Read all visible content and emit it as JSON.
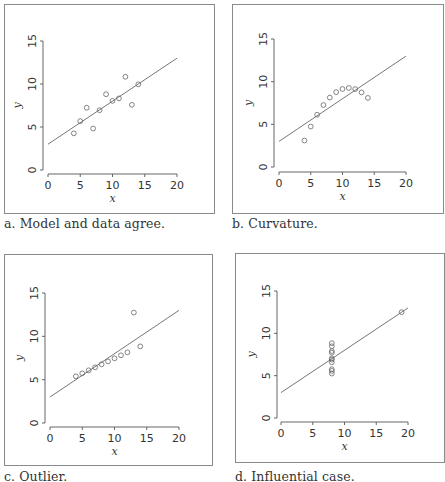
{
  "chart_data": [
    {
      "id": "a",
      "type": "scatter",
      "caption": "a. Model and data agree.",
      "xlabel": "x",
      "ylabel": "y",
      "xlim": [
        0,
        20
      ],
      "ylim": [
        0,
        15
      ],
      "xticks": [
        "0",
        "5",
        "10",
        "15",
        "20"
      ],
      "yticks": [
        "0",
        "5",
        "10",
        "15"
      ],
      "fit_line": {
        "intercept": 3.0,
        "slope": 0.5,
        "x_range": [
          0,
          20
        ]
      },
      "points": [
        {
          "x": 10,
          "y": 8.04
        },
        {
          "x": 8,
          "y": 6.95
        },
        {
          "x": 13,
          "y": 7.58
        },
        {
          "x": 9,
          "y": 8.81
        },
        {
          "x": 11,
          "y": 8.33
        },
        {
          "x": 14,
          "y": 9.96
        },
        {
          "x": 6,
          "y": 7.24
        },
        {
          "x": 4,
          "y": 4.26
        },
        {
          "x": 12,
          "y": 10.84
        },
        {
          "x": 7,
          "y": 4.82
        },
        {
          "x": 5,
          "y": 5.68
        }
      ],
      "grid": false,
      "marker": "open-circle"
    },
    {
      "id": "b",
      "type": "scatter",
      "caption": "b. Curvature.",
      "xlabel": "x",
      "ylabel": "y",
      "xlim": [
        0,
        20
      ],
      "ylim": [
        0,
        15
      ],
      "xticks": [
        "0",
        "5",
        "10",
        "15",
        "20"
      ],
      "yticks": [
        "0",
        "5",
        "10",
        "15"
      ],
      "fit_line": {
        "intercept": 3.0,
        "slope": 0.5,
        "x_range": [
          0,
          20
        ]
      },
      "points": [
        {
          "x": 10,
          "y": 9.14
        },
        {
          "x": 8,
          "y": 8.14
        },
        {
          "x": 13,
          "y": 8.74
        },
        {
          "x": 9,
          "y": 8.77
        },
        {
          "x": 11,
          "y": 9.26
        },
        {
          "x": 14,
          "y": 8.1
        },
        {
          "x": 6,
          "y": 6.13
        },
        {
          "x": 4,
          "y": 3.1
        },
        {
          "x": 12,
          "y": 9.13
        },
        {
          "x": 7,
          "y": 7.26
        },
        {
          "x": 5,
          "y": 4.74
        }
      ],
      "grid": false,
      "marker": "open-circle"
    },
    {
      "id": "c",
      "type": "scatter",
      "caption": "c. Outlier.",
      "xlabel": "x",
      "ylabel": "y",
      "xlim": [
        0,
        20
      ],
      "ylim": [
        0,
        15
      ],
      "xticks": [
        "0",
        "5",
        "10",
        "15",
        "20"
      ],
      "yticks": [
        "0",
        "5",
        "10",
        "15"
      ],
      "fit_line": {
        "intercept": 3.0,
        "slope": 0.5,
        "x_range": [
          0,
          20
        ]
      },
      "points": [
        {
          "x": 10,
          "y": 7.46
        },
        {
          "x": 8,
          "y": 6.77
        },
        {
          "x": 13,
          "y": 12.74
        },
        {
          "x": 9,
          "y": 7.11
        },
        {
          "x": 11,
          "y": 7.81
        },
        {
          "x": 14,
          "y": 8.84
        },
        {
          "x": 6,
          "y": 6.08
        },
        {
          "x": 4,
          "y": 5.39
        },
        {
          "x": 12,
          "y": 8.15
        },
        {
          "x": 7,
          "y": 6.42
        },
        {
          "x": 5,
          "y": 5.73
        }
      ],
      "grid": false,
      "marker": "open-circle"
    },
    {
      "id": "d",
      "type": "scatter",
      "caption": "d. Influential case.",
      "xlabel": "x",
      "ylabel": "y",
      "xlim": [
        0,
        20
      ],
      "ylim": [
        0,
        15
      ],
      "xticks": [
        "0",
        "5",
        "10",
        "15",
        "20"
      ],
      "yticks": [
        "0",
        "5",
        "10",
        "15"
      ],
      "fit_line": {
        "intercept": 3.0,
        "slope": 0.5,
        "x_range": [
          0,
          20
        ]
      },
      "points": [
        {
          "x": 8,
          "y": 6.58
        },
        {
          "x": 8,
          "y": 5.76
        },
        {
          "x": 8,
          "y": 7.71
        },
        {
          "x": 8,
          "y": 8.84
        },
        {
          "x": 8,
          "y": 8.47
        },
        {
          "x": 8,
          "y": 7.04
        },
        {
          "x": 8,
          "y": 5.25
        },
        {
          "x": 19,
          "y": 12.5
        },
        {
          "x": 8,
          "y": 5.56
        },
        {
          "x": 8,
          "y": 7.91
        },
        {
          "x": 8,
          "y": 6.89
        }
      ],
      "grid": false,
      "marker": "open-circle"
    }
  ]
}
